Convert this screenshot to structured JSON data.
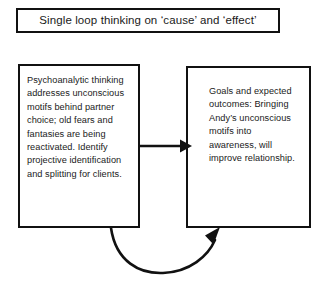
{
  "diagram": {
    "title": {
      "text": "Single loop thinking on ‘cause’ and ‘effect’"
    },
    "nodes": {
      "cause": {
        "label": "Psychoanalytic thinking addresses unconscious motifs behind partner choice; old fears and fantasies are being reactivated. Identify projective identification and splitting for clients."
      },
      "effect": {
        "label": "Goals and expected outcomes: Bringing Andy’s unconscious motifs into awareness, will improve relationship."
      }
    },
    "connectors": {
      "forward_arrow": "cause-to-effect-arrow",
      "feedback_arrow": "effect-feedback-loop-arrow"
    },
    "colors": {
      "stroke": "#111111",
      "text": "#1a1a1a",
      "background": "#ffffff"
    }
  }
}
